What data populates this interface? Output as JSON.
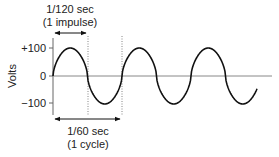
{
  "diagram": {
    "y_axis": {
      "label": "Volts",
      "ticks": [
        "+100",
        "0",
        "−100"
      ]
    },
    "top_annotation": {
      "line1": "1/120 sec",
      "line2": "(1 impulse)"
    },
    "bottom_annotation": {
      "line1": "1/60 sec",
      "line2": "(1 cycle)"
    },
    "wave": {
      "amplitude": 100,
      "cycles_shown": 3,
      "color": "#111111"
    }
  }
}
